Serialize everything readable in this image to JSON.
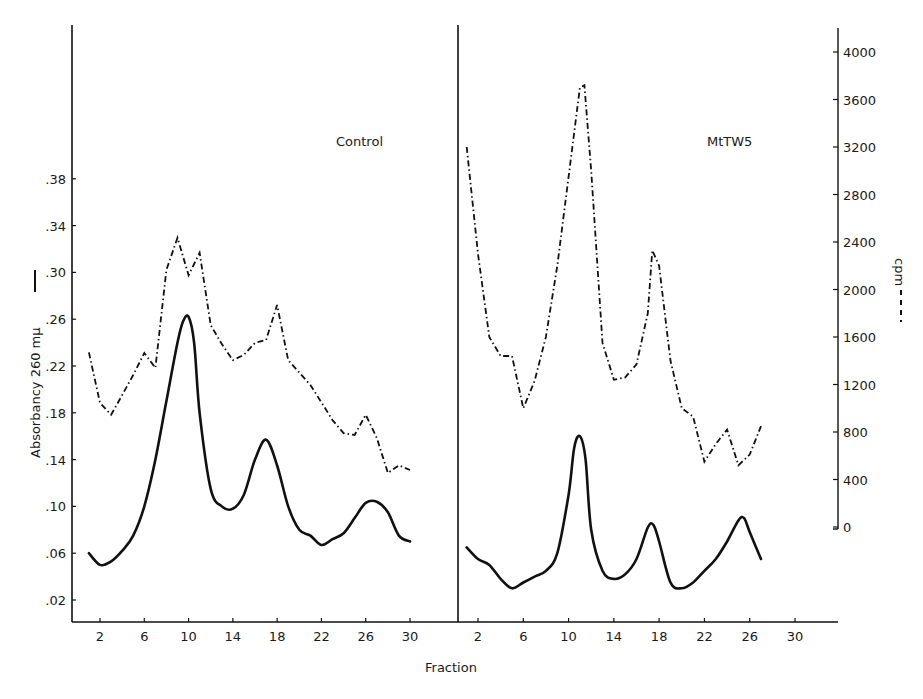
{
  "chart_data": {
    "type": "line",
    "title": "",
    "xlabel": "Fraction",
    "ylabel_left": "Absorbancy  260 mμ",
    "ylabel_left_legend": "solid line",
    "ylabel_right": "cpm",
    "ylabel_right_legend": "dashed line",
    "xlim": [
      0,
      34
    ],
    "ylim_left": [
      0.0,
      0.42
    ],
    "ylim_right": [
      0,
      4000
    ],
    "grid": false,
    "x_ticks": [
      "2",
      "6",
      "10",
      "14",
      "18",
      "22",
      "26",
      "30"
    ],
    "y_ticks_left": [
      ".02",
      ".06",
      ".10",
      ".14",
      ".18",
      ".22",
      ".26",
      ".30",
      ".34",
      ".38"
    ],
    "y_ticks_right": [
      "0",
      "400",
      "800",
      "1200",
      "1600",
      "2000",
      "2400",
      "2800",
      "3200",
      "3600",
      "4000"
    ],
    "panels": [
      {
        "label": "Control",
        "series": [
          {
            "name": "Absorbancy 260 mμ",
            "style": "solid",
            "axis": "left",
            "x": [
              1,
              2,
              3,
              4,
              5,
              6,
              7,
              8,
              9,
              9.5,
              10,
              10.5,
              11,
              12,
              13,
              14,
              15,
              16,
              17,
              18,
              19,
              20,
              21,
              22,
              23,
              24,
              25,
              26,
              27,
              28,
              29,
              30
            ],
            "values": [
              0.06,
              0.05,
              0.053,
              0.062,
              0.075,
              0.1,
              0.14,
              0.19,
              0.24,
              0.258,
              0.262,
              0.24,
              0.18,
              0.115,
              0.1,
              0.098,
              0.11,
              0.14,
              0.157,
              0.135,
              0.1,
              0.08,
              0.075,
              0.067,
              0.072,
              0.077,
              0.09,
              0.103,
              0.104,
              0.095,
              0.075,
              0.07
            ]
          },
          {
            "name": "cpm",
            "style": "dashed",
            "axis": "right",
            "x": [
              1,
              2,
              3,
              4,
              5,
              6,
              7,
              8,
              9,
              10,
              11,
              12,
              13,
              14,
              15,
              16,
              17,
              18,
              19,
              20,
              21,
              22,
              23,
              24,
              25,
              26,
              27,
              28,
              29,
              30
            ],
            "values": [
              1470,
              1045,
              945,
              1110,
              1280,
              1465,
              1340,
              2165,
              2435,
              2120,
              2310,
              1700,
              1540,
              1405,
              1450,
              1550,
              1575,
              1870,
              1405,
              1300,
              1195,
              1050,
              900,
              790,
              775,
              945,
              750,
              455,
              520,
              480
            ]
          }
        ]
      },
      {
        "label": "MtTW5",
        "series": [
          {
            "name": "Absorbancy 260 mμ",
            "style": "solid",
            "axis": "left",
            "x": [
              1,
              2,
              3,
              4,
              5,
              6,
              7,
              8,
              9,
              10,
              10.5,
              11,
              11.5,
              12,
              13,
              14,
              15,
              16,
              17,
              17.5,
              18,
              19,
              20,
              21,
              22,
              23,
              24,
              25,
              25.5,
              26,
              27
            ],
            "values": [
              0.065,
              0.055,
              0.05,
              0.038,
              0.03,
              0.035,
              0.04,
              0.045,
              0.06,
              0.11,
              0.15,
              0.16,
              0.14,
              0.08,
              0.045,
              0.038,
              0.042,
              0.055,
              0.082,
              0.084,
              0.07,
              0.035,
              0.03,
              0.035,
              0.045,
              0.055,
              0.07,
              0.088,
              0.09,
              0.078,
              0.055
            ]
          },
          {
            "name": "cpm",
            "style": "dashed",
            "axis": "right",
            "x": [
              1,
              2,
              3,
              4,
              5,
              6,
              7,
              8,
              9,
              10,
              11,
              11.4,
              12,
              13,
              14,
              15,
              16,
              17,
              17.4,
              18,
              19,
              20,
              21,
              22,
              23,
              24,
              25,
              26,
              26.5,
              27
            ],
            "values": [
              3200,
              2300,
              1600,
              1440,
              1440,
              1000,
              1230,
              1600,
              2200,
              2950,
              3700,
              3720,
              3000,
              1550,
              1240,
              1260,
              1370,
              1800,
              2330,
              2200,
              1400,
              1000,
              930,
              550,
              700,
              820,
              520,
              610,
              730,
              850
            ]
          }
        ]
      }
    ],
    "legend_position": "axis labels (line style markers beside axis titles)"
  },
  "layout": {
    "colors": {
      "ink": "#111111",
      "background": "#ffffff"
    }
  }
}
